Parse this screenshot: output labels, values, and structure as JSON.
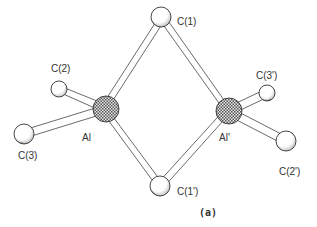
{
  "diagram": {
    "type": "ball-and-stick molecular structure",
    "caption": "(a)",
    "atoms": [
      {
        "id": "Al",
        "label": "Al",
        "element": "Al",
        "x": 106,
        "y": 109,
        "r": 13,
        "style": "crosshatched"
      },
      {
        "id": "Al'",
        "label": "Al'",
        "element": "Al",
        "x": 229,
        "y": 111,
        "r": 13,
        "style": "crosshatched"
      },
      {
        "id": "C1",
        "label": "C(1)",
        "element": "C",
        "x": 161,
        "y": 17,
        "r": 10,
        "style": "open"
      },
      {
        "id": "C1'",
        "label": "C(1')",
        "element": "C",
        "x": 160,
        "y": 186,
        "r": 10,
        "style": "open"
      },
      {
        "id": "C2",
        "label": "C(2)",
        "element": "C",
        "x": 59,
        "y": 89,
        "r": 8,
        "style": "open"
      },
      {
        "id": "C3",
        "label": "C(3)",
        "element": "C",
        "x": 24,
        "y": 134,
        "r": 10,
        "style": "open"
      },
      {
        "id": "C3'",
        "label": "C(3')",
        "element": "C",
        "x": 267,
        "y": 93,
        "r": 8,
        "style": "open"
      },
      {
        "id": "C2'",
        "label": "C(2')",
        "element": "C",
        "x": 286,
        "y": 141,
        "r": 10,
        "style": "open"
      }
    ],
    "bonds": [
      [
        "Al",
        "C1"
      ],
      [
        "Al",
        "C1'"
      ],
      [
        "Al'",
        "C1"
      ],
      [
        "Al'",
        "C1'"
      ],
      [
        "Al",
        "C2"
      ],
      [
        "Al",
        "C3"
      ],
      [
        "Al'",
        "C3'"
      ],
      [
        "Al'",
        "C2'"
      ]
    ],
    "labels": {
      "c1": "C(1)",
      "c1p": "C(1')",
      "c2": "C(2)",
      "c3": "C(3)",
      "c3p": "C(3')",
      "c2p": "C(2')",
      "al": "Al",
      "alp": "Al'"
    }
  }
}
